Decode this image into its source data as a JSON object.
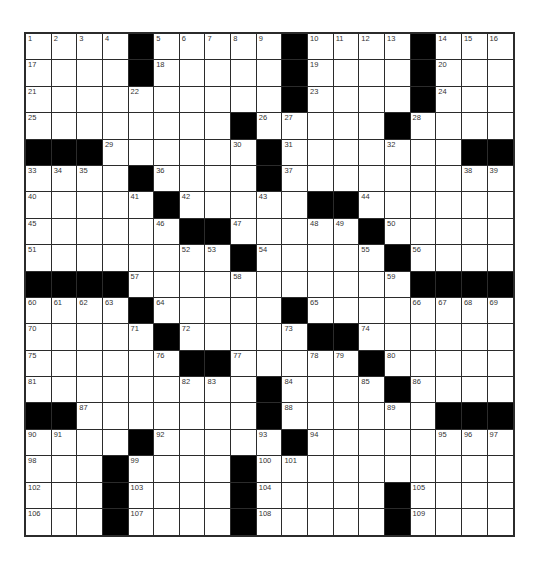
{
  "puzzle": {
    "rows": 19,
    "cols": 19,
    "colors": {
      "block": "#000000",
      "cell": "#ffffff",
      "line": "#2b2b2b",
      "number": "#333333"
    },
    "layout": [
      [
        "1",
        "2",
        "3",
        "4",
        "#",
        "5",
        "6",
        "7",
        "8",
        "9",
        "#",
        "10",
        "11",
        "12",
        "13",
        "#",
        "14",
        "15",
        "16"
      ],
      [
        "17",
        "",
        "",
        "",
        "#",
        "18",
        "",
        "",
        "",
        "",
        "#",
        "19",
        "",
        "",
        "",
        "#",
        "20",
        "",
        ""
      ],
      [
        "21",
        "",
        "",
        "",
        "22",
        "",
        "",
        "",
        "",
        "",
        "#",
        "23",
        "",
        "",
        "",
        "#",
        "24",
        "",
        ""
      ],
      [
        "25",
        "",
        "",
        "",
        "",
        "",
        "",
        "",
        "#",
        "26",
        "27",
        "",
        "",
        "",
        "#",
        "28",
        "",
        "",
        ""
      ],
      [
        "#",
        "#",
        "#",
        "29",
        "",
        "",
        "",
        "",
        "30",
        "#",
        "31",
        "",
        "",
        "",
        "32",
        "",
        "",
        "#",
        "#"
      ],
      [
        "33",
        "34",
        "35",
        "",
        "#",
        "36",
        "",
        "",
        "",
        "#",
        "37",
        "",
        "",
        "",
        "",
        "",
        "",
        "38",
        "39"
      ],
      [
        "40",
        "",
        "",
        "",
        "41",
        "#",
        "42",
        "",
        "",
        "43",
        "",
        "#",
        "#",
        "44",
        "",
        "",
        "",
        "",
        ""
      ],
      [
        "45",
        "",
        "",
        "",
        "",
        "46",
        "#",
        "#",
        "47",
        "",
        "",
        "48",
        "49",
        "#",
        "50",
        "",
        "",
        "",
        ""
      ],
      [
        "51",
        "",
        "",
        "",
        "",
        "",
        "52",
        "53",
        "#",
        "54",
        "",
        "",
        "",
        "55",
        "#",
        "56",
        "",
        "",
        ""
      ],
      [
        "#",
        "#",
        "#",
        "#",
        "57",
        "",
        "",
        "",
        "58",
        "",
        "",
        "",
        "",
        "",
        "59",
        "#",
        "#",
        "#",
        "#"
      ],
      [
        "60",
        "61",
        "62",
        "63",
        "#",
        "64",
        "",
        "",
        "",
        "",
        "#",
        "65",
        "",
        "",
        "",
        "66",
        "67",
        "68",
        "69"
      ],
      [
        "70",
        "",
        "",
        "",
        "71",
        "#",
        "72",
        "",
        "",
        "",
        "73",
        "#",
        "#",
        "74",
        "",
        "",
        "",
        "",
        ""
      ],
      [
        "75",
        "",
        "",
        "",
        "",
        "76",
        "#",
        "#",
        "77",
        "",
        "",
        "78",
        "79",
        "#",
        "80",
        "",
        "",
        "",
        ""
      ],
      [
        "81",
        "",
        "",
        "",
        "",
        "",
        "82",
        "83",
        "",
        "#",
        "84",
        "",
        "",
        "85",
        "#",
        "86",
        "",
        "",
        ""
      ],
      [
        "#",
        "#",
        "87",
        "",
        "",
        "",
        "",
        "",
        "",
        "#",
        "88",
        "",
        "",
        "",
        "89",
        "",
        "#",
        "#",
        "#"
      ],
      [
        "90",
        "91",
        "",
        "",
        "#",
        "92",
        "",
        "",
        "",
        "93",
        "#",
        "94",
        "",
        "",
        "",
        "",
        "95",
        "96",
        "97"
      ],
      [
        "98",
        "",
        "",
        "#",
        "99",
        "",
        "",
        "",
        "#",
        "100",
        "101",
        "",
        "",
        "",
        "",
        "",
        "",
        "",
        ""
      ],
      [
        "102",
        "",
        "",
        "#",
        "103",
        "",
        "",
        "",
        "#",
        "104",
        "",
        "",
        "",
        "",
        "#",
        "105",
        "",
        "",
        ""
      ],
      [
        "106",
        "",
        "",
        "#",
        "107",
        "",
        "",
        "",
        "#",
        "108",
        "",
        "",
        "",
        "",
        "#",
        "109",
        "",
        "",
        ""
      ]
    ],
    "entries": []
  }
}
